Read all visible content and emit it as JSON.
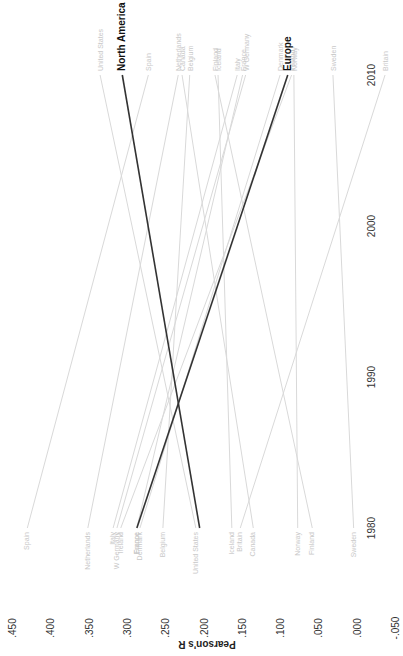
{
  "chart_data": {
    "type": "line",
    "subtype": "slope",
    "orientation": "rotated 90deg clockwise",
    "title": "",
    "xlabel": "",
    "ylabel": "Pearson's R",
    "x_ticks": [
      "1980",
      "1990",
      "2000",
      "2010"
    ],
    "y_ticks": [
      ".450",
      ".400",
      ".350",
      ".300",
      ".250",
      ".200",
      ".150",
      ".100",
      ".050",
      ".000",
      "-.050"
    ],
    "ylim": [
      -0.05,
      0.45
    ],
    "xlim": [
      1980,
      2010
    ],
    "grid": false,
    "x": [
      1980,
      2010
    ],
    "series": [
      {
        "name": "North America",
        "kind": "region",
        "values": [
          0.205,
          0.306
        ]
      },
      {
        "name": "Europe",
        "kind": "region",
        "values": [
          0.287,
          0.09
        ]
      },
      {
        "name": "Spain",
        "kind": "country",
        "values": [
          0.43,
          0.272
        ]
      },
      {
        "name": "Netherlands",
        "kind": "country",
        "values": [
          0.351,
          0.233
        ]
      },
      {
        "name": "Italy",
        "kind": "country",
        "values": [
          0.318,
          0.156
        ]
      },
      {
        "name": "W Germany",
        "kind": "country",
        "values": [
          0.313,
          0.145
        ]
      },
      {
        "name": "Ireland",
        "kind": "country",
        "values": [
          0.308,
          0.085
        ]
      },
      {
        "name": "France",
        "kind": "country",
        "values": [
          0.287,
          0.149
        ]
      },
      {
        "name": "Denmark",
        "kind": "country",
        "values": [
          0.283,
          0.1
        ]
      },
      {
        "name": "Belgium",
        "kind": "country",
        "values": [
          0.253,
          0.218
        ]
      },
      {
        "name": "United States",
        "kind": "country",
        "values": [
          0.21,
          0.335
        ]
      },
      {
        "name": "Iceland",
        "kind": "country",
        "values": [
          0.163,
          0.181
        ]
      },
      {
        "name": "Britain",
        "kind": "country",
        "values": [
          0.152,
          -0.037
        ]
      },
      {
        "name": "Canada",
        "kind": "country",
        "values": [
          0.135,
          0.228
        ]
      },
      {
        "name": "Norway",
        "kind": "country",
        "values": [
          0.077,
          0.082
        ]
      },
      {
        "name": "Finland",
        "kind": "country",
        "values": [
          0.058,
          0.185
        ]
      },
      {
        "name": "Sweden",
        "kind": "country",
        "values": [
          0.004,
          0.031
        ]
      }
    ]
  },
  "colors": {
    "region_line": "#333333",
    "country_line": "#d9d9d9",
    "country_label": "#c8c8c8",
    "tick_text": "#333333"
  }
}
